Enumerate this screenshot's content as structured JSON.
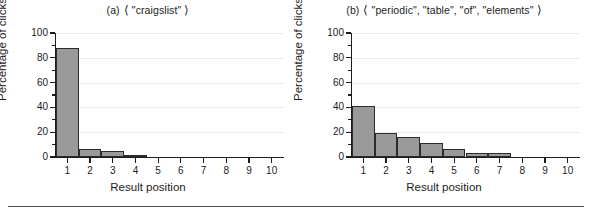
{
  "figure": {
    "bottom_rule": true,
    "bar_color": "#9a9a9a",
    "bar_edge_color": "#2b2b2b",
    "grid_color": "#d9d9d9",
    "axis_color": "#1c1c1c"
  },
  "panels": [
    {
      "tag": "(a)",
      "bracket_open": "⟨",
      "bracket_close": "⟩",
      "query": "\"craigslist\"",
      "xlabel": "Result position",
      "ylabel": "Percentage of clicks"
    },
    {
      "tag": "(b)",
      "bracket_open": "⟨",
      "bracket_close": "⟩",
      "query": "\"periodic\", \"table\", \"of\", \"elements\"",
      "xlabel": "Result position",
      "ylabel": "Percentage of clicks"
    }
  ],
  "chart_data": [
    {
      "type": "bar",
      "title": "(a)  ⟨ \"craigslist\" ⟩",
      "xlabel": "Result position",
      "ylabel": "Percentage of clicks",
      "categories": [
        "1",
        "2",
        "3",
        "4",
        "5",
        "6",
        "7",
        "8",
        "9",
        "10"
      ],
      "values": [
        88,
        6.5,
        4.5,
        0.6,
        0.3,
        0.2,
        0.1,
        0.1,
        0.1,
        0.1
      ],
      "ylim": [
        0,
        100
      ],
      "yticks": [
        0,
        20,
        40,
        60,
        80,
        100
      ],
      "yticks_minor": [
        10,
        30,
        50,
        70,
        90
      ],
      "grid": "horizontal-dotted",
      "legend": "none"
    },
    {
      "type": "bar",
      "title": "(b)  ⟨ \"periodic\", \"table\", \"of\", \"elements\" ⟩",
      "xlabel": "Result position",
      "ylabel": "Percentage of clicks",
      "categories": [
        "1",
        "2",
        "3",
        "4",
        "5",
        "6",
        "7",
        "8",
        "9",
        "10"
      ],
      "values": [
        41,
        19,
        16,
        11,
        6.5,
        3.5,
        3.3,
        0.2,
        0.2,
        0.2
      ],
      "ylim": [
        0,
        100
      ],
      "yticks": [
        0,
        20,
        40,
        60,
        80,
        100
      ],
      "yticks_minor": [
        10,
        30,
        50,
        70,
        90
      ],
      "grid": "horizontal-dotted",
      "legend": "none"
    }
  ]
}
